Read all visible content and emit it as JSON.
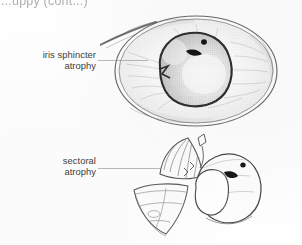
{
  "figure": {
    "running_header": "...uppy (cont...)",
    "type": "line-drawing illustration",
    "background_color": "#fefefe",
    "ink_color": "#3a3a3a"
  },
  "annotations": [
    {
      "id": "iris-sphincter-atrophy",
      "line1": "iris sphincter",
      "line2": "atrophy",
      "leader": "horizontal-line-to-pupil-margin"
    },
    {
      "id": "sectoral-atrophy",
      "line1": "sectoral",
      "line2": "atrophy",
      "leader": "horizontal-line-to-iris-sector"
    }
  ],
  "illustrations": [
    {
      "id": "eye-frontal-view",
      "name": "frontal view of eye with iris sphincter atrophy",
      "features": [
        "eyelid margin line upper-left",
        "limbus / corneal outline ellipse",
        "stippled iris surface with radial striae",
        "irregular dilated pupil with notched margin",
        "dark pigment rests on pupil margin"
      ]
    },
    {
      "id": "iris-sectoral-view",
      "name": "oblique view of iris showing sectoral atrophy",
      "features": [
        "wedge-shaped thinned iris sector peeled forward",
        "radial fold lines within sector",
        "remaining iris body with pupil",
        "dark pigment fleck on pupil margin"
      ]
    }
  ]
}
